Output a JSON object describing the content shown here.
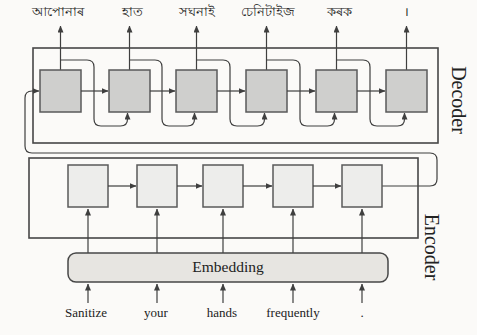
{
  "figure": {
    "type": "encoder-decoder-seq2seq-diagram",
    "decoder": {
      "label": "Decoder",
      "cell_count": 6,
      "outputs": [
        "আপোনাৰ",
        "হাত",
        "সঘনাই",
        "চেনিটাইজ",
        "কৰক",
        "।"
      ]
    },
    "encoder": {
      "label": "Encoder",
      "cell_count": 5
    },
    "embedding": {
      "label": "Embedding"
    },
    "inputs": [
      "Sanitize",
      "your",
      "hands",
      "frequently",
      "."
    ]
  },
  "colors": {
    "background": "#fbfaf8",
    "line": "#3f3f3f",
    "box_border": "#474747",
    "decoder_cell_fill": "#cfcfcd",
    "encoder_cell_fill": "#ededeb",
    "cell_border": "#5a5a5a",
    "embedding_fill": "#e7e5e1",
    "text": "#222222"
  }
}
